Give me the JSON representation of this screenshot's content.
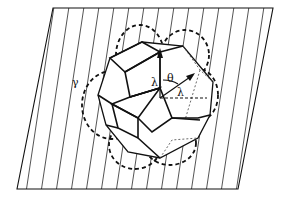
{
  "figure": {
    "labels": {
      "gamma": "γ",
      "lambda_vertical": "λ",
      "theta": "θ",
      "lambda_horizontal": "λ"
    },
    "colors": {
      "ink": "#111111",
      "background": "#ffffff"
    }
  }
}
